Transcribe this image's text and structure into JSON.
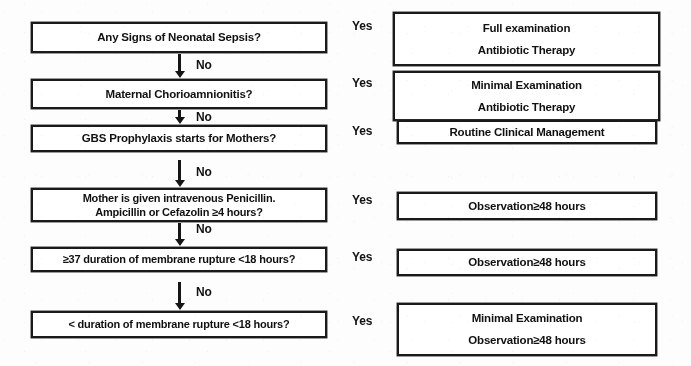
{
  "diagram": {
    "type": "flowchart",
    "colors": {
      "border": "#1a1a1a",
      "text": "#111111",
      "background": "#ffffff"
    },
    "decisions": [
      {
        "id": "neonatal-sepsis",
        "lines": [
          "Any Signs of Neonatal Sepsis?"
        ],
        "yes_label": "Yes",
        "no_label": "No"
      },
      {
        "id": "chorioamnionitis",
        "lines": [
          "Maternal Chorioamnionitis?"
        ],
        "yes_label": "Yes",
        "no_label": "No"
      },
      {
        "id": "gbs-prophylaxis",
        "lines": [
          "GBS Prophylaxis starts for Mothers?"
        ],
        "yes_label": "Yes",
        "no_label": "No"
      },
      {
        "id": "intravenous-antibiotics",
        "lines": [
          "Mother is given intravenous Penicillin.",
          "Ampicillin or Cefazolin ≥4 hours?"
        ],
        "yes_label": "Yes",
        "no_label": "No"
      },
      {
        "id": "membrane-rupture-37",
        "lines": [
          "≥37 duration of membrane rupture <18 hours?"
        ],
        "yes_label": "Yes",
        "no_label": "No"
      },
      {
        "id": "membrane-rupture-lt",
        "lines": [
          "< duration of membrane rupture <18 hours?"
        ],
        "yes_label": "Yes",
        "no_label": ""
      }
    ],
    "outcomes": [
      {
        "id": "full-exam-antibiotics",
        "lines": [
          "Full examination",
          "Antibiotic Therapy"
        ]
      },
      {
        "id": "minimal-exam-antibiotics",
        "lines": [
          "Minimal Examination",
          "Antibiotic Therapy"
        ]
      },
      {
        "id": "routine-clinical-management",
        "lines": [
          "Routine Clinical Management"
        ]
      },
      {
        "id": "observation-48-a",
        "lines": [
          "Observation≥48 hours"
        ]
      },
      {
        "id": "observation-48-b",
        "lines": [
          "Observation≥48 hours"
        ]
      },
      {
        "id": "minimal-exam-observation",
        "lines": [
          "Minimal Examination",
          "Observation≥48 hours"
        ]
      }
    ]
  }
}
